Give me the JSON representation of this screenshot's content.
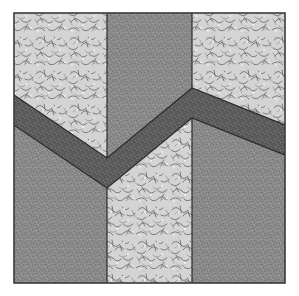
{
  "canvas": {
    "width": 299,
    "height": 296,
    "background": "#ffffff"
  },
  "block": {
    "title": "Chevron Quilt Block",
    "type": "pieced-quilt-block",
    "frame": {
      "x": 14,
      "y": 13,
      "width": 271,
      "height": 270
    },
    "outline_color": "#3a3a3a",
    "seam_color": "#2e2e2e",
    "seam_width": 1.2
  },
  "fabrics": {
    "light_floral": {
      "name": "light-floral-print",
      "base": "#d3d3d3",
      "speckle_dark": "#7d7d7d",
      "speckle_light": "#f0f0f0"
    },
    "medium_gray": {
      "name": "medium-gray-solid",
      "base": "#8a8a8a",
      "speckle_dark": "#6e6e6e",
      "speckle_light": "#9e9e9e"
    },
    "dark_gray": {
      "name": "dark-gray-texture",
      "base": "#5e5e5e",
      "speckle_dark": "#484848",
      "speckle_light": "#737373"
    }
  },
  "geometry": {
    "vertical_seams_x": [
      107,
      192
    ],
    "chevron_valley": {
      "x": 107,
      "y": 158
    },
    "chevron_peak": {
      "x": 192,
      "y": 88
    },
    "band_left_edge_y": [
      95,
      125
    ],
    "band_right_edge_y": [
      125,
      155
    ],
    "band_thickness": 30
  },
  "patches": [
    {
      "id": "top-left-floral",
      "fabric": "light_floral",
      "label": "Top left floral wedge"
    },
    {
      "id": "top-center-gray",
      "fabric": "medium_gray",
      "label": "Top center gray wedge"
    },
    {
      "id": "top-right-floral",
      "fabric": "light_floral",
      "label": "Top right floral wedge"
    },
    {
      "id": "chevron-band-left",
      "fabric": "dark_gray",
      "label": "Dark chevron band left arm"
    },
    {
      "id": "chevron-band-center",
      "fabric": "dark_gray",
      "label": "Dark chevron band center arm"
    },
    {
      "id": "chevron-band-right",
      "fabric": "dark_gray",
      "label": "Dark chevron band right arm"
    },
    {
      "id": "bottom-left-gray",
      "fabric": "medium_gray",
      "label": "Bottom left gray column"
    },
    {
      "id": "bottom-center-floral",
      "fabric": "light_floral",
      "label": "Bottom center floral column"
    },
    {
      "id": "bottom-right-gray",
      "fabric": "medium_gray",
      "label": "Bottom right gray column"
    }
  ]
}
